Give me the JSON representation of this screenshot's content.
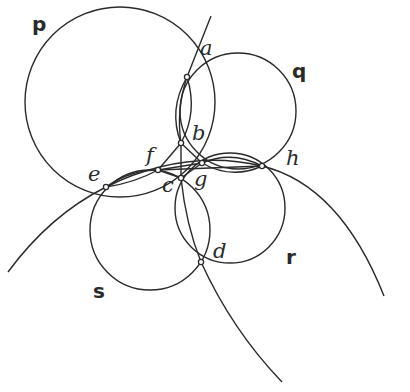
{
  "diagram": {
    "stroke_color": "#2a2a2a",
    "background": "#ffffff",
    "circles": [
      {
        "name": "p",
        "label": "p",
        "cx": 120,
        "cy": 102,
        "r": 95,
        "label_x": 30,
        "label_y": 30
      },
      {
        "name": "q",
        "label": "q",
        "cx": 238,
        "cy": 111,
        "r": 58,
        "label_x": 294,
        "label_y": 76
      },
      {
        "name": "s",
        "label": "s",
        "cx": 150,
        "cy": 230,
        "r": 60,
        "label_x": 94,
        "label_y": 297
      },
      {
        "name": "r",
        "label": "r",
        "cx": 230,
        "cy": 208,
        "r": 55,
        "label_x": 287,
        "label_y": 264
      }
    ],
    "points": [
      {
        "name": "a",
        "label": "a",
        "x": 187,
        "y": 77,
        "label_x": 200,
        "label_y": 55
      },
      {
        "name": "b",
        "label": "b",
        "x": 181,
        "y": 143,
        "label_x": 194,
        "label_y": 140
      },
      {
        "name": "f",
        "label": "f",
        "x": 158,
        "y": 170,
        "label_x": 146,
        "label_y": 163
      },
      {
        "name": "g",
        "label": "g",
        "x": 202,
        "y": 163,
        "label_x": 196,
        "label_y": 190
      },
      {
        "name": "c",
        "label": "c",
        "x": 181,
        "y": 178,
        "label_x": 164,
        "label_y": 194
      },
      {
        "name": "h",
        "label": "h",
        "x": 262,
        "y": 166,
        "label_x": 287,
        "label_y": 166
      },
      {
        "name": "e",
        "label": "e",
        "x": 106,
        "y": 187,
        "label_x": 89,
        "label_y": 182
      },
      {
        "name": "d",
        "label": "d",
        "x": 201,
        "y": 262,
        "label_x": 214,
        "label_y": 259
      }
    ],
    "labels": {
      "p": "p",
      "q": "q",
      "r": "r",
      "s": "s",
      "a": "a",
      "b": "b",
      "c": "c",
      "d": "d",
      "e": "e",
      "f": "f",
      "g": "g",
      "h": "h"
    }
  }
}
